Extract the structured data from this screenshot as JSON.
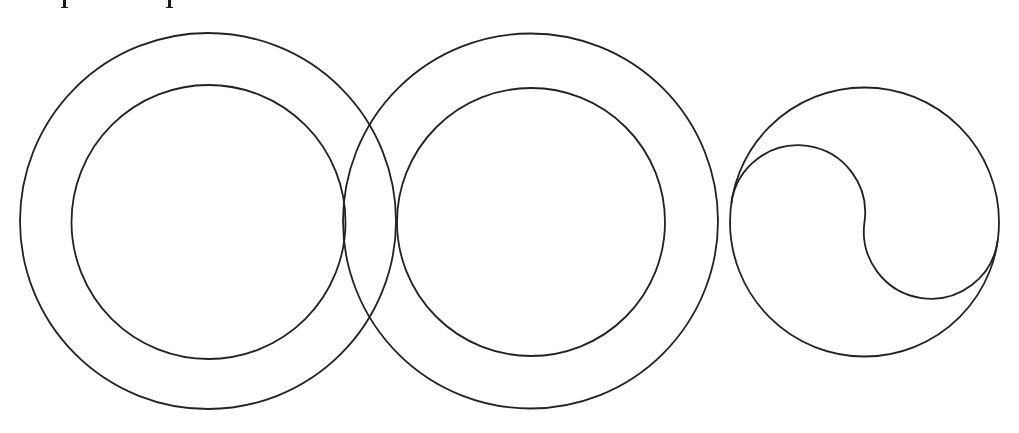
{
  "figure": {
    "width": 1019,
    "height": 433,
    "stroke_color": "#222222",
    "stroke_width": 1.8,
    "background": "#ffffff",
    "clipped_text_marks": [
      {
        "x": 63
      },
      {
        "x": 168
      }
    ],
    "ring_pairs": [
      {
        "name": "left-ring",
        "outer": {
          "cx": 208,
          "cy": 221,
          "r": 188
        },
        "inner": {
          "cx": 208.5,
          "cy": 222,
          "r": 137
        }
      },
      {
        "name": "middle-ring",
        "outer": {
          "cx": 530.5,
          "cy": 221,
          "r": 187.5
        },
        "inner": {
          "cx": 531,
          "cy": 222,
          "r": 134
        }
      }
    ],
    "yin_yang": {
      "cx": 864.5,
      "cy": 222,
      "r": 134.5,
      "rotation_deg": 8.1,
      "description": "Circle divided by an S-shaped curve made of two semicircles"
    }
  }
}
